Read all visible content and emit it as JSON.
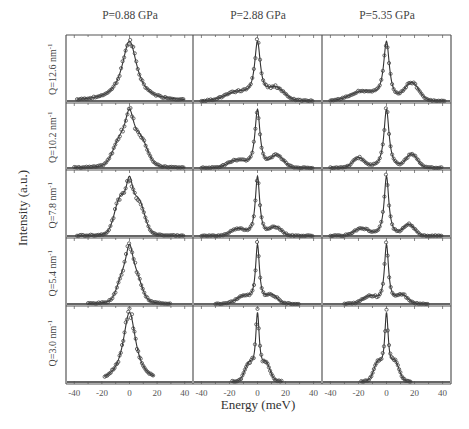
{
  "chart_data": {
    "type": "scatter",
    "title": "",
    "layout": "grid 5 rows x 3 columns, shared axes, data points (open circles) with fitted line",
    "xlabel": "Energy (meV)",
    "ylabel": "Intensity (a.u.)",
    "xlim": [
      -46,
      46
    ],
    "xticks": [
      -40,
      -20,
      0,
      20,
      40
    ],
    "grid": false,
    "legend": "none",
    "columns": [
      {
        "key": "p088",
        "title": "P=0.88 GPa"
      },
      {
        "key": "p288",
        "title": "P=2.88 GPa"
      },
      {
        "key": "p535",
        "title": "P=5.35 GPa"
      }
    ],
    "rows": [
      {
        "key": "q126",
        "label": "Q=12.6 nm",
        "sup": "-1"
      },
      {
        "key": "q102",
        "label": "Q=10.2 nm",
        "sup": "-1"
      },
      {
        "key": "q78",
        "label": "Q=7.8 nm",
        "sup": "-1"
      },
      {
        "key": "q54",
        "label": "Q=5.4 nm",
        "sup": "-1"
      },
      {
        "key": "q30",
        "label": "Q=3.0 nm",
        "sup": "-1"
      }
    ],
    "panels": [
      [
        {
          "central": {
            "amp": 1.0,
            "width": 6.5
          },
          "side": [],
          "xrange": [
            -38,
            40
          ]
        },
        {
          "central": {
            "amp": 0.95,
            "width": 4.2
          },
          "side": [
            {
              "pos": -7,
              "amp": 0.45,
              "width": 5
            },
            {
              "pos": 8,
              "amp": 0.5,
              "width": 5
            }
          ],
          "xrange": [
            -40,
            40
          ]
        },
        {
          "central": {
            "amp": 0.95,
            "width": 3.5
          },
          "side": [
            {
              "pos": -7,
              "amp": 0.6,
              "width": 4
            },
            {
              "pos": 7,
              "amp": 0.55,
              "width": 4
            }
          ],
          "xrange": [
            -38,
            40
          ]
        },
        {
          "central": {
            "amp": 0.95,
            "width": 3.5
          },
          "side": [
            {
              "pos": -5,
              "amp": 0.45,
              "width": 4
            },
            {
              "pos": 5,
              "amp": 0.45,
              "width": 4
            }
          ],
          "xrange": [
            -30,
            30
          ]
        },
        {
          "central": {
            "amp": 0.95,
            "width": 5.5
          },
          "side": [],
          "xrange": [
            -18,
            18
          ]
        }
      ],
      [
        {
          "central": {
            "amp": 1.0,
            "width": 2.5
          },
          "side": [
            {
              "pos": -14,
              "amp": 0.15,
              "width": 9
            },
            {
              "pos": 13,
              "amp": 0.22,
              "width": 6
            }
          ],
          "xrange": [
            -40,
            40
          ]
        },
        {
          "central": {
            "amp": 1.0,
            "width": 2.2
          },
          "side": [
            {
              "pos": -15,
              "amp": 0.12,
              "width": 6
            },
            {
              "pos": 14,
              "amp": 0.2,
              "width": 4.5
            }
          ],
          "xrange": [
            -40,
            40
          ]
        },
        {
          "central": {
            "amp": 1.0,
            "width": 1.9
          },
          "side": [
            {
              "pos": -14,
              "amp": 0.11,
              "width": 5
            },
            {
              "pos": 13,
              "amp": 0.14,
              "width": 4
            }
          ],
          "xrange": [
            -40,
            40
          ]
        },
        {
          "central": {
            "amp": 1.0,
            "width": 1.7
          },
          "side": [
            {
              "pos": -10,
              "amp": 0.12,
              "width": 5
            },
            {
              "pos": 10,
              "amp": 0.14,
              "width": 4
            }
          ],
          "xrange": [
            -30,
            30
          ]
        },
        {
          "central": {
            "amp": 1.0,
            "width": 1.6
          },
          "side": [
            {
              "pos": -6,
              "amp": 0.25,
              "width": 3
            },
            {
              "pos": 6,
              "amp": 0.25,
              "width": 3
            }
          ],
          "xrange": [
            -18,
            18
          ]
        }
      ],
      [
        {
          "central": {
            "amp": 1.0,
            "width": 2.5
          },
          "side": [
            {
              "pos": -17,
              "amp": 0.15,
              "width": 9
            },
            {
              "pos": 18,
              "amp": 0.3,
              "width": 5
            }
          ],
          "xrange": [
            -40,
            42
          ]
        },
        {
          "central": {
            "amp": 0.9,
            "width": 2.2
          },
          "side": [
            {
              "pos": -20,
              "amp": 0.15,
              "width": 4
            },
            {
              "pos": 18,
              "amp": 0.2,
              "width": 4
            }
          ],
          "xrange": [
            -40,
            40
          ]
        },
        {
          "central": {
            "amp": 1.0,
            "width": 2.0
          },
          "side": [
            {
              "pos": -18,
              "amp": 0.12,
              "width": 5
            },
            {
              "pos": 16,
              "amp": 0.18,
              "width": 4
            }
          ],
          "xrange": [
            -40,
            40
          ]
        },
        {
          "central": {
            "amp": 1.0,
            "width": 1.8
          },
          "side": [
            {
              "pos": -12,
              "amp": 0.12,
              "width": 5
            },
            {
              "pos": 11,
              "amp": 0.14,
              "width": 4
            }
          ],
          "xrange": [
            -30,
            30
          ]
        },
        {
          "central": {
            "amp": 1.0,
            "width": 1.6
          },
          "side": [
            {
              "pos": -6,
              "amp": 0.27,
              "width": 3
            },
            {
              "pos": 6,
              "amp": 0.27,
              "width": 3
            }
          ],
          "xrange": [
            -18,
            18
          ]
        }
      ]
    ]
  },
  "axes": {
    "xlabel": "Energy (meV)",
    "ylabel": "Intensity (a.u.)",
    "tick_labels": [
      "-40",
      "-20",
      "0",
      "20",
      "40"
    ]
  },
  "columns": [
    {
      "title": "P=0.88 GPa"
    },
    {
      "title": "P=2.88 GPa"
    },
    {
      "title": "P=5.35 GPa"
    }
  ],
  "rows": [
    {
      "label": "Q=12.6 nm",
      "sup": "-1"
    },
    {
      "label": "Q=10.2 nm",
      "sup": "-1"
    },
    {
      "label": "Q=7.8 nm",
      "sup": "-1"
    },
    {
      "label": "Q=5.4 nm",
      "sup": "-1"
    },
    {
      "label": "Q=3.0 nm",
      "sup": "-1"
    }
  ],
  "style": {
    "axis_color": "#555555",
    "line_color": "#333333",
    "marker_color": "#444444"
  }
}
